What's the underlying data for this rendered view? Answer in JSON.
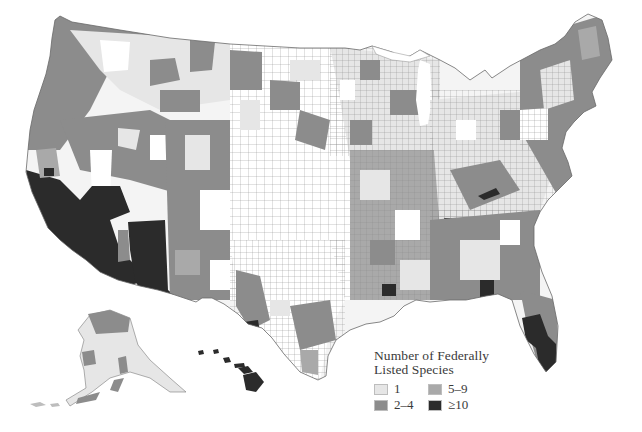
{
  "map": {
    "title": "Number of Federally Listed Species",
    "subject": "United States counties",
    "regions_shown": [
      "Contiguous United States",
      "Alaska",
      "Hawaii"
    ],
    "colors": {
      "background": "#ffffff",
      "county_border": "#7a7a7a",
      "class_1": "#e6e6e6",
      "class_2_4": "#8c8c8c",
      "class_5_9": "#a9a9a9",
      "class_10_plus": "#2b2b2b",
      "no_data": "#ffffff"
    }
  },
  "legend": {
    "title_line1": "Number of Federally",
    "title_line2": "Listed Species",
    "items": [
      {
        "label": "1",
        "color": "#e6e6e6"
      },
      {
        "label": "5–9",
        "color": "#a9a9a9"
      },
      {
        "label": "2–4",
        "color": "#8c8c8c"
      },
      {
        "label": "≥10",
        "color": "#2b2b2b"
      }
    ]
  }
}
